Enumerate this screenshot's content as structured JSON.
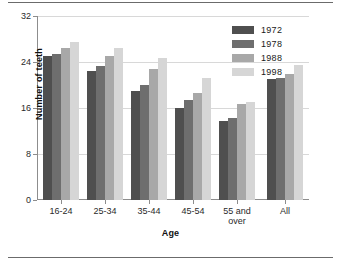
{
  "chart_data": {
    "type": "bar",
    "title": "",
    "xlabel": "Age",
    "ylabel": "Number of teeth",
    "categories": [
      "16-24",
      "25-34",
      "35-44",
      "45-54",
      "55 and\nover",
      "All"
    ],
    "series": [
      {
        "name": "1972",
        "color": "#4f4f4f",
        "values": [
          25.0,
          22.5,
          19.0,
          16.0,
          13.8,
          21.0
        ]
      },
      {
        "name": "1978",
        "color": "#6e6e6e",
        "values": [
          25.4,
          23.3,
          20.0,
          17.4,
          14.3,
          21.3
        ]
      },
      {
        "name": "1988",
        "color": "#a8a8a8",
        "values": [
          26.5,
          25.0,
          22.7,
          18.6,
          16.7,
          22.0
        ]
      },
      {
        "name": "1998",
        "color": "#d6d6d6",
        "values": [
          27.5,
          26.5,
          24.7,
          21.2,
          17.1,
          23.5
        ]
      }
    ],
    "yticks": [
      0,
      8,
      16,
      24,
      32
    ],
    "ylim": [
      0,
      32
    ],
    "grid": true,
    "legend_position": "top-right",
    "legend_entries": [
      "1972",
      "1978",
      "1988",
      "1998"
    ]
  },
  "legend": {
    "items": [
      {
        "label": "1972"
      },
      {
        "label": "1978"
      },
      {
        "label": "1988"
      },
      {
        "label": "1998"
      }
    ]
  },
  "axes": {
    "y_title": "Number of teeth",
    "x_title": "Age",
    "y_tick_labels": [
      "0",
      "8",
      "16",
      "24",
      "32"
    ],
    "x_tick_labels": [
      "16-24",
      "25-34",
      "35-44",
      "45-54",
      "55 and\nover",
      "All"
    ]
  },
  "colors": {
    "series_1972": "#4f4f4f",
    "series_1978": "#6e6e6e",
    "series_1988": "#a8a8a8",
    "series_1998": "#d6d6d6",
    "axis": "#8d8d8d",
    "grid": "#d8d8d8",
    "rule": "#6b6b6b",
    "background": "#ffffff"
  }
}
